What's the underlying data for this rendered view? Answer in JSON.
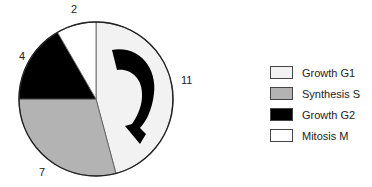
{
  "chart_data": {
    "type": "pie",
    "title": "",
    "unit": "hours",
    "start_angle": "top (12 o'clock)",
    "direction": "clockwise",
    "categories": [
      "Growth G1",
      "Synthesis S",
      "Growth G2",
      "Mitosis M"
    ],
    "values": [
      11,
      7,
      4,
      2
    ],
    "colors": [
      "#f2f2f2",
      "#b3b3b3",
      "#000000",
      "#ffffff"
    ],
    "slice_labels": [
      "11",
      "7",
      "4",
      "2"
    ],
    "legend_position": "right",
    "annotation": "curved clockwise arrow inside Growth G1 slice"
  },
  "labels": {
    "g1": "11",
    "s": "7",
    "g2": "4",
    "m": "2"
  },
  "legend": [
    {
      "label": "Growth G1",
      "color": "#f2f2f2"
    },
    {
      "label": "Synthesis S",
      "color": "#b3b3b3"
    },
    {
      "label": "Growth G2",
      "color": "#000000"
    },
    {
      "label": "Mitosis M",
      "color": "#ffffff"
    }
  ]
}
